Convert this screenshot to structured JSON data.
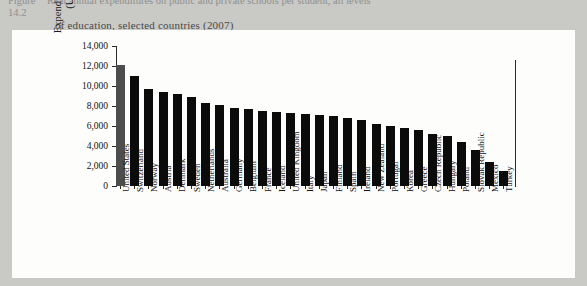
{
  "caption": {
    "figure_number": "Figure 14.2",
    "line1": "Real annual expenditures on public and private schools per student, all levels",
    "line2": "of education, selected countries (2007)"
  },
  "chart_data": {
    "type": "bar",
    "title": "",
    "xlabel": "",
    "ylabel_line1": "Expenditure per student",
    "ylabel_line2": "(US dollars)",
    "ylim": [
      0,
      14000
    ],
    "ytick_labels": [
      "14,000",
      "12,000",
      "10,000",
      "8,000",
      "6,000",
      "4,000",
      "2,000",
      "0"
    ],
    "ytick_values": [
      14000,
      12000,
      10000,
      8000,
      6000,
      4000,
      2000,
      0
    ],
    "grid": false,
    "legend": "none",
    "highlight_color": "#4d4d4d",
    "bar_color": "#0b0b0b",
    "categories": [
      "United States",
      "Switzerland",
      "Norway",
      "Austria",
      "Denmark",
      "Sweden",
      "Netherlands",
      "Australia",
      "Germany",
      "Belgium",
      "France",
      "Iceland",
      "United Kingdom",
      "Italy",
      "Japan",
      "Finland",
      "Spain",
      "Ireland",
      "New Zealand",
      "Portugal",
      "Korea",
      "Greece",
      "Czech Republic",
      "Hungary",
      "Poland",
      "Slovak Republic",
      "Mexico",
      "Turkey"
    ],
    "values": [
      12100,
      11000,
      9700,
      9400,
      9200,
      8900,
      8300,
      8100,
      7800,
      7700,
      7500,
      7400,
      7300,
      7200,
      7100,
      7000,
      6800,
      6600,
      6200,
      6000,
      5800,
      5600,
      5200,
      5000,
      4400,
      3600,
      2400,
      1500
    ]
  }
}
